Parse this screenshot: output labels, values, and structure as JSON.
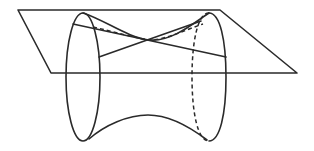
{
  "figure": {
    "colors": {
      "stroke": "#2a2a2a",
      "background": "#ffffff"
    },
    "plane": {
      "points": [
        [
          18,
          10
        ],
        [
          220,
          10
        ],
        [
          297,
          73
        ],
        [
          51,
          73
        ]
      ]
    },
    "left_ellipse": {
      "cx": 83,
      "cy": 77,
      "rx": 17,
      "ry": 64
    },
    "right_ellipse": {
      "cx": 209,
      "cy": 77,
      "rx": 17,
      "ry": 64
    },
    "neck_point": [
      150,
      40
    ],
    "generators": [
      {
        "from": [
          73,
          24
        ],
        "to": [
          226,
          57
        ]
      },
      {
        "from": [
          99,
          57
        ],
        "to": [
          201,
          21
        ]
      }
    ]
  }
}
